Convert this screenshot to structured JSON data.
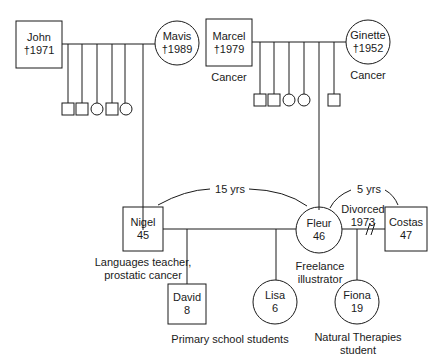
{
  "people": {
    "john": {
      "name": "John",
      "info": "†1971"
    },
    "mavis": {
      "name": "Mavis",
      "info": "†1989"
    },
    "marcel": {
      "name": "Marcel",
      "info": "†1979",
      "note": "Cancer"
    },
    "ginette": {
      "name": "Ginette",
      "info": "†1952",
      "note": "Cancer"
    },
    "nigel": {
      "name": "Nigel",
      "info": "45",
      "note_line1": "Languages teacher,",
      "note_line2": "prostatic cancer"
    },
    "fleur": {
      "name": "Fleur",
      "info": "46",
      "note_line1": "Freelance",
      "note_line2": "illustrator"
    },
    "costas": {
      "name": "Costas",
      "info": "47"
    },
    "david": {
      "name": "David",
      "info": "8"
    },
    "lisa": {
      "name": "Lisa",
      "info": "6"
    },
    "fiona": {
      "name": "Fiona",
      "info": "19",
      "note_line1": "Natural Therapies",
      "note_line2": "student"
    }
  },
  "relations": {
    "nigel_fleur_gap": "15 yrs",
    "fleur_costas_gap": "5 yrs",
    "divorce_line1": "Divorced",
    "divorce_line2": "1973"
  },
  "group_notes": {
    "children": "Primary school students"
  }
}
